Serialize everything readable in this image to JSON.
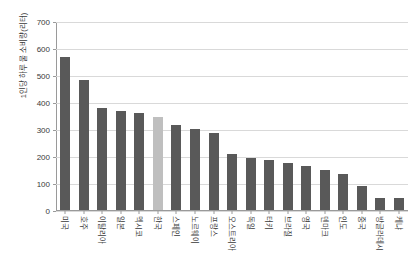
{
  "chart_data": {
    "type": "bar",
    "title": "",
    "subtitle": "",
    "xlabel": "",
    "ylabel": "1인당 하루 물 소비량(리터)",
    "ylim": [
      0,
      700
    ],
    "yticks": [
      0,
      100,
      200,
      300,
      400,
      500,
      600,
      700
    ],
    "ytick_labels": [
      "0",
      "100",
      "200",
      "300",
      "400",
      "500",
      "600",
      "700"
    ],
    "grid": true,
    "legend": "none",
    "categories": [
      "미국",
      "호주",
      "이탈리아",
      "일본",
      "멕시코",
      "한국",
      "스페인",
      "노르웨이",
      "프랑스",
      "오스트리아",
      "독일",
      "터키",
      "브라질",
      "영국",
      "덴마크",
      "인도",
      "중국",
      "방글라데시",
      "케냐"
    ],
    "values": [
      570,
      485,
      380,
      370,
      362,
      345,
      315,
      300,
      287,
      209,
      193,
      188,
      175,
      165,
      150,
      135,
      88,
      46,
      46
    ],
    "highlight_index": 5,
    "colors": {
      "bar": "#595959",
      "bar_highlight": "#bfbfbf",
      "gridline": "#d9d9d9",
      "axis": "#9a9a9a",
      "text": "#3a3a3a",
      "background": "#ffffff"
    }
  }
}
